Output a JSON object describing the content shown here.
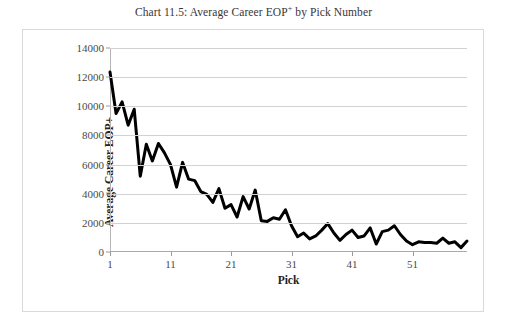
{
  "chart_data": {
    "type": "line",
    "title": "Chart 11.5: Average Career EOP+ by Pick Number",
    "title_main": "Chart 11.5: Average Career EOP",
    "title_sup": "+",
    "title_tail": " by Pick Number",
    "xlabel": "Pick",
    "ylabel": "Average Career EOP+",
    "xlim": [
      1,
      60
    ],
    "ylim": [
      0,
      14000
    ],
    "ytick_labels": [
      "14000",
      "12000",
      "10000",
      "8000",
      "6000",
      "4000",
      "2000",
      "0"
    ],
    "ytick_values": [
      14000,
      12000,
      10000,
      8000,
      6000,
      4000,
      2000,
      0
    ],
    "xtick_labels": [
      "1",
      "11",
      "21",
      "31",
      "41",
      "51"
    ],
    "xtick_values": [
      1,
      11,
      21,
      31,
      41,
      51
    ],
    "grid": "horizontal",
    "legend": "none",
    "line_color": "#000000",
    "line_width": 3,
    "x": [
      1,
      2,
      3,
      4,
      5,
      6,
      7,
      8,
      9,
      10,
      11,
      12,
      13,
      14,
      15,
      16,
      17,
      18,
      19,
      20,
      21,
      22,
      23,
      24,
      25,
      26,
      27,
      28,
      29,
      30,
      31,
      32,
      33,
      34,
      35,
      36,
      37,
      38,
      39,
      40,
      41,
      42,
      43,
      44,
      45,
      46,
      47,
      48,
      49,
      50,
      51,
      52,
      53,
      54,
      55,
      56,
      57,
      58,
      59,
      60
    ],
    "values": [
      12350,
      9500,
      10300,
      8700,
      9800,
      5200,
      7400,
      6250,
      7450,
      6800,
      6000,
      4450,
      6150,
      5000,
      4900,
      4150,
      3950,
      3400,
      4350,
      3000,
      3250,
      2400,
      3800,
      2950,
      4250,
      2150,
      2100,
      2350,
      2250,
      2900,
      1800,
      1050,
      1300,
      900,
      1100,
      1500,
      1950,
      1300,
      800,
      1200,
      1500,
      1000,
      1100,
      1650,
      550,
      1400,
      1500,
      1800,
      1200,
      750,
      500,
      700,
      650,
      650,
      600,
      950,
      600,
      700,
      300,
      750
    ],
    "series_name": "Average Career EOP+"
  },
  "figure": {
    "border_color": "#d9d9d9",
    "background": "#ffffff"
  }
}
